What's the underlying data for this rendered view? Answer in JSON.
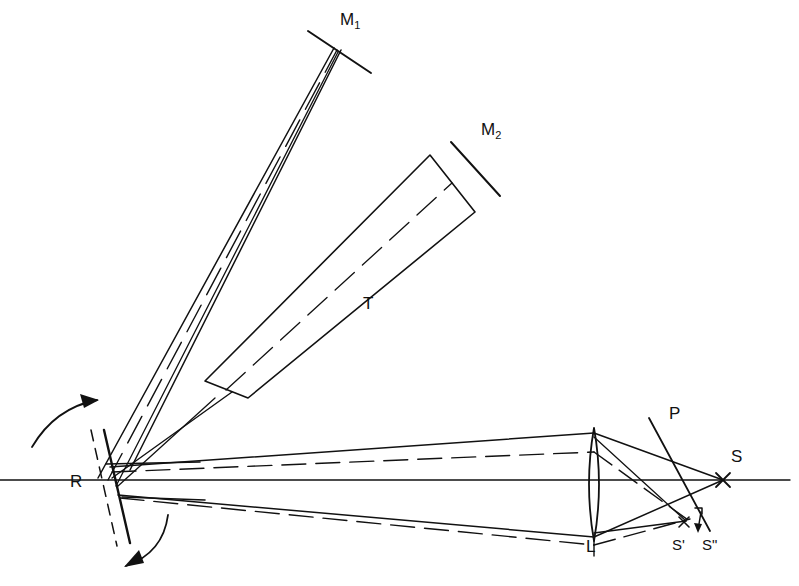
{
  "figure": {
    "domain": "diagram",
    "kind": "optical-ray-diagram",
    "background_color": "#ffffff",
    "ink_color": "#111111"
  },
  "labels": {
    "m1": {
      "text": "M",
      "sub": "1",
      "x": 346,
      "y": 18
    },
    "m2": {
      "text": "M",
      "sub": "2",
      "x": 487,
      "y": 128
    },
    "tube": {
      "text": "T",
      "x": 366,
      "y": 303
    },
    "rotor": {
      "text": "R",
      "x": 74,
      "y": 482
    },
    "lens": {
      "text": "L",
      "x": 589,
      "y": 547
    },
    "plate": {
      "text": "P",
      "x": 673,
      "y": 412
    },
    "source": {
      "text": "S",
      "x": 735,
      "y": 455
    },
    "s_prime": {
      "text": "S'",
      "x": 676,
      "y": 545
    },
    "s_double_prime": {
      "text": "S\"",
      "x": 706,
      "y": 545
    }
  },
  "components": {
    "rotating_mirror": {
      "name": "R",
      "role": "rotating mirror",
      "solid_line": {
        "x1": 104,
        "y1": 432,
        "x2": 128,
        "y2": 540
      },
      "dashed_line": {
        "x1": 92,
        "y1": 432,
        "x2": 116,
        "y2": 542
      },
      "rotation_arrows": 2
    },
    "mirror_m1": {
      "name": "M1",
      "role": "distant plane mirror",
      "tick": {
        "x1": 308,
        "y1": 31,
        "x2": 371,
        "y2": 73
      }
    },
    "mirror_m2": {
      "name": "M2",
      "role": "plane mirror at tube end",
      "tick": {
        "x1": 451,
        "y1": 142,
        "x2": 500,
        "y2": 196
      }
    },
    "tube": {
      "name": "T",
      "role": "evacuated tube",
      "corners": [
        [
          205,
          381
        ],
        [
          430,
          155
        ],
        [
          475,
          212
        ],
        [
          248,
          398
        ]
      ],
      "has_center_dashed_axis": true
    },
    "lens": {
      "name": "L",
      "role": "converging lens",
      "center_x": 594,
      "top_y": 428,
      "bottom_y": 541,
      "half_width": 9
    },
    "plate": {
      "name": "P",
      "role": "inclined glass plate / plane of observation",
      "line": {
        "x1": 649,
        "y1": 418,
        "x2": 709,
        "y2": 530
      }
    },
    "optical_axis": {
      "role": "horizontal optical axis",
      "line": {
        "x1": 0,
        "y1": 480,
        "x2": 790,
        "y2": 480
      }
    },
    "image_points": {
      "S": {
        "x": 723,
        "y": 480,
        "marker": "cross"
      },
      "S_prime": {
        "x": 684,
        "y": 522,
        "marker": "cross"
      },
      "S_double_prime": {
        "x": 700,
        "y": 520,
        "marker": "tick-arrow"
      }
    }
  },
  "rays": {
    "solid_color": "#111111",
    "dashed_color": "#111111",
    "upper_beam_to_m1": "narrow bundle from R up to M1 with dashed central ray",
    "right_beam_to_lens": "diverging bundle from R to lens L, solid envelope plus dashed displaced rays",
    "converging_beam": "from lens L converging toward S and S'/S'' region"
  }
}
